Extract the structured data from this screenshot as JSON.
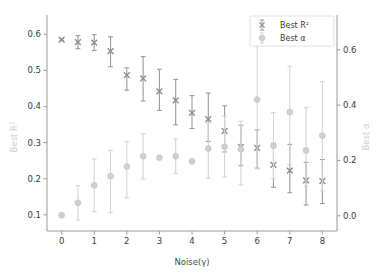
{
  "chart_data": {
    "type": "scatter",
    "title": "",
    "xlabel": "Noise(γ)",
    "ylabel": "Best R²",
    "y2label": "Best α",
    "xlim": [
      -0.45,
      8.45
    ],
    "ylim": [
      0.055,
      0.645
    ],
    "y2lim": [
      -0.055,
      0.715
    ],
    "xticks": [
      "0",
      "1",
      "2",
      "3",
      "4",
      "5",
      "6",
      "7",
      "8"
    ],
    "xtickvalues": [
      0,
      1,
      2,
      3,
      4,
      5,
      6,
      7,
      8
    ],
    "yticks": [
      "0.1",
      "0.2",
      "0.3",
      "0.4",
      "0.5",
      "0.6"
    ],
    "ytickvalues": [
      0.1,
      0.2,
      0.3,
      0.4,
      0.5,
      0.6
    ],
    "y2ticks": [
      "0.0",
      "0.2",
      "0.4",
      "0.6"
    ],
    "y2tickvalues": [
      0.0,
      0.2,
      0.4,
      0.6
    ],
    "grid": false,
    "legend_position": "top-right",
    "series": [
      {
        "name": "Best R²",
        "marker": "x",
        "color": "#9a9a9a",
        "axis": "left",
        "x": [
          0,
          0.5,
          1,
          1.5,
          2,
          2.5,
          3,
          3.5,
          4,
          4.5,
          5,
          5.5,
          6,
          6.5,
          7,
          7.5,
          8
        ],
        "values": [
          0.585,
          0.578,
          0.577,
          0.553,
          0.487,
          0.478,
          0.442,
          0.417,
          0.382,
          0.365,
          0.332,
          0.288,
          0.285,
          0.238,
          0.222,
          0.195,
          0.193
        ],
        "err_low": [
          0.003,
          0.018,
          0.022,
          0.043,
          0.042,
          0.063,
          0.053,
          0.068,
          0.043,
          0.062,
          0.058,
          0.052,
          0.056,
          0.062,
          0.061,
          0.068,
          0.062
        ],
        "err_high": [
          0.003,
          0.018,
          0.022,
          0.04,
          0.02,
          0.06,
          0.061,
          0.058,
          0.048,
          0.072,
          0.07,
          0.06,
          0.05,
          0.06,
          0.073,
          0.05,
          0.06
        ]
      },
      {
        "name": "Best α",
        "marker": "o",
        "color": "#d4d4d4",
        "axis": "right",
        "x": [
          0,
          0.5,
          1,
          1.5,
          2,
          2.5,
          3,
          3.5,
          4,
          4.5,
          5,
          5.5,
          6,
          6.5,
          7,
          7.5,
          8
        ],
        "values": [
          0.002,
          0.047,
          0.11,
          0.143,
          0.178,
          0.215,
          0.21,
          0.215,
          0.197,
          0.243,
          0.25,
          0.24,
          0.42,
          0.253,
          0.375,
          0.236,
          0.29
        ],
        "err_low": [
          0.0,
          0.063,
          0.095,
          0.132,
          0.113,
          0.082,
          0.0,
          0.062,
          0.0,
          0.107,
          0.11,
          0.128,
          0.25,
          0.118,
          0.19,
          0.13,
          0.2
        ],
        "err_high": [
          0.0,
          0.062,
          0.095,
          0.093,
          0.09,
          0.082,
          0.0,
          0.062,
          0.0,
          0.092,
          0.11,
          0.102,
          0.265,
          0.12,
          0.165,
          0.155,
          0.195
        ]
      }
    ]
  },
  "legend": {
    "items": [
      {
        "label": "Best R²",
        "marker": "x"
      },
      {
        "label": "Best α",
        "marker": "o"
      }
    ]
  },
  "axes": {
    "x_label": "Noise(γ)",
    "y_left_label": "Best R²",
    "y_right_label": "Best α"
  }
}
